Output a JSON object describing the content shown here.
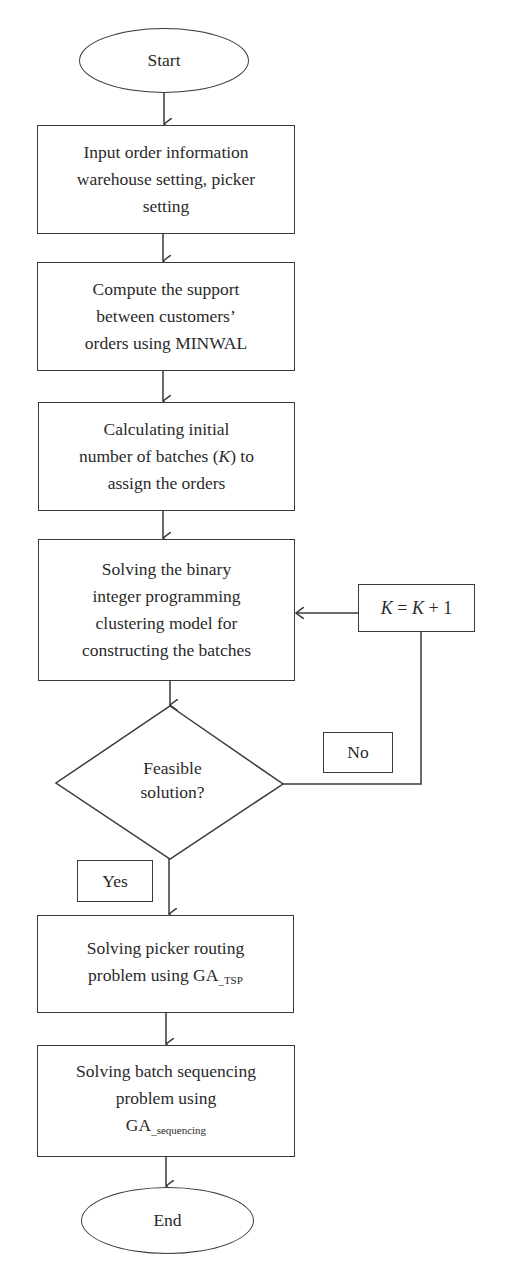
{
  "flowchart": {
    "start": {
      "label": "Start"
    },
    "steps": [
      {
        "id": "input",
        "lines": [
          "Input order information",
          "warehouse setting, picker",
          "setting"
        ]
      },
      {
        "id": "support",
        "lines": [
          "Compute the support",
          "between customers’",
          "orders using MINWAL"
        ]
      },
      {
        "id": "initial-k",
        "line1": "Calculating initial",
        "line2_pre": "number of batches (",
        "line2_var": "K",
        "line2_post": ") to",
        "line3": "assign the orders"
      },
      {
        "id": "bip",
        "lines": [
          "Solving the binary",
          "integer programming",
          "clustering model for",
          "constructing the batches"
        ]
      },
      {
        "id": "routing",
        "line1": "Solving picker routing",
        "line2_pre": "problem using GA",
        "line2_sub": "_TSP"
      },
      {
        "id": "sequencing",
        "line1": "Solving batch sequencing",
        "line2": "problem using",
        "line3_pre": "GA",
        "line3_sub": "_sequencing"
      }
    ],
    "decision": {
      "lines": [
        "Feasible",
        "solution?"
      ]
    },
    "increment": {
      "var1": "K",
      "eq": " = ",
      "var2": "K",
      "rest": " + 1"
    },
    "branch_labels": {
      "no": "No",
      "yes": "Yes"
    },
    "end": {
      "label": "End"
    },
    "colors": {
      "stroke": "#3a3a3a",
      "text": "#2a2a2a",
      "background": "#ffffff"
    }
  }
}
